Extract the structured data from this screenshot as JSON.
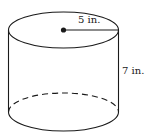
{
  "figure": {
    "shape": "cylinder",
    "radius_label": "5 in.",
    "height_label": "7 in.",
    "colors": {
      "stroke": "#1a1a1a",
      "background": "#ffffff"
    }
  }
}
